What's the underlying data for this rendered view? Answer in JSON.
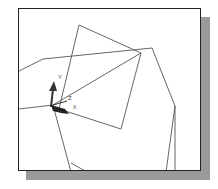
{
  "viewport": {
    "axis_labels": {
      "y": "Y",
      "z": "Z",
      "x": "X"
    },
    "colors": {
      "frame": "#222222",
      "lines": "#555555",
      "shadow": "#9a9a9a",
      "triad": "#333333"
    }
  }
}
